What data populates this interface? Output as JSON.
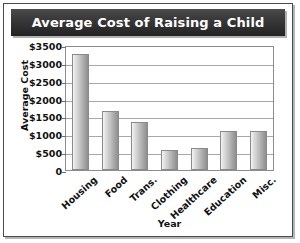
{
  "figure": {
    "title": "Average Cost of Raising a Child",
    "frame_color": "#4a4a4a",
    "title_bar_color": "#2b2b2b",
    "title_text_color": "#ffffff",
    "bar_color": "#ababab",
    "gridline_color": "#a8a8a8",
    "background_color": "#ffffff"
  },
  "chart_data": {
    "type": "bar",
    "title": "Average Cost of Raising a Child",
    "xlabel": "Year",
    "ylabel": "Average Cost",
    "categories": [
      "Housing",
      "Food",
      "Trans.",
      "Clothing",
      "Healthcare",
      "Education",
      "Misc."
    ],
    "values": [
      3250,
      1650,
      1350,
      550,
      620,
      1100,
      1100
    ],
    "ylim": [
      0,
      3500
    ],
    "ytick_values": [
      0,
      500,
      1000,
      1500,
      2000,
      2500,
      3000,
      3500
    ],
    "ytick_labels": [
      "0",
      "$500",
      "$1000",
      "$1500",
      "$2000",
      "$2500",
      "$3000",
      "$3500"
    ],
    "grid": true,
    "legend": false,
    "xtick_rotation": -42
  }
}
